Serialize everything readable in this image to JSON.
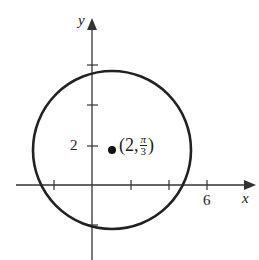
{
  "diagram": {
    "top_text": ") ) (",
    "y_axis_label": "y",
    "x_axis_label": "x",
    "y_tick_label": "2",
    "x_tick_label": "6",
    "point_label_prefix": "(2,",
    "point_label_pi": "π",
    "point_label_den": "3",
    "point_label_suffix": ")",
    "colors": {
      "stroke": "#222222",
      "background": "#ffffff"
    }
  }
}
